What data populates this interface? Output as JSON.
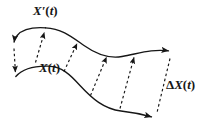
{
  "figure": {
    "type": "vector-displacement-diagram",
    "width": 214,
    "height": 132,
    "background_color": "#ffffff",
    "stroke_color": "#161616",
    "labels": {
      "upper_curve": {
        "name": "X'(t)",
        "var": "X",
        "prime": "′",
        "open_paren": "(",
        "arg": "t",
        "close_paren": ")"
      },
      "lower_curve": {
        "name": "X(t)",
        "var": "X",
        "open_paren": "(",
        "arg": "t",
        "close_paren": ")"
      },
      "displacement": {
        "name": "ΔX(t)",
        "delta": "Δ",
        "var": "X",
        "open_paren": "(",
        "arg": "t",
        "close_paren": ")"
      }
    },
    "curves": [
      {
        "id": "upper-curve",
        "label": "X'(t)",
        "style": "solid",
        "start_arrowhead": true,
        "end_arrowhead": true
      },
      {
        "id": "lower-curve",
        "label": "X(t)",
        "style": "solid",
        "start_arrowhead": false,
        "end_arrowhead": true
      }
    ],
    "connectors": [
      {
        "id": "connector-1",
        "style": "dashed",
        "direction": "down"
      },
      {
        "id": "connector-2",
        "style": "dashed",
        "direction": "up"
      },
      {
        "id": "connector-3",
        "style": "dashed",
        "direction": "up"
      },
      {
        "id": "connector-4",
        "style": "dashed",
        "direction": "up"
      },
      {
        "id": "connector-5",
        "style": "dashed",
        "direction": "up"
      },
      {
        "id": "connector-6",
        "style": "dashed",
        "direction": "down"
      }
    ]
  }
}
